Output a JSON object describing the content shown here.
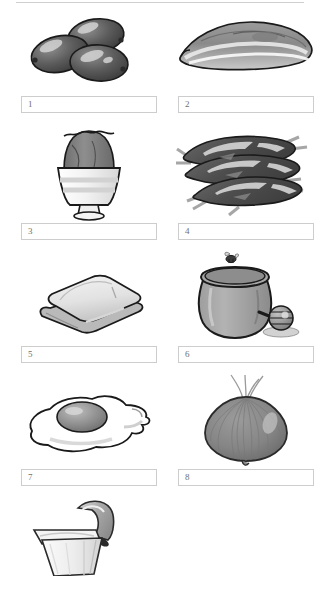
{
  "page": {
    "top_rule_color": "#cfcfcf",
    "box_border_color": "#cdcdcd",
    "number_color": "#6f6f6f",
    "background": "#ffffff"
  },
  "items": [
    {
      "number": "1",
      "value": "",
      "placeholder": "",
      "picture": "olives-illustration",
      "alt": "three black olives"
    },
    {
      "number": "2",
      "value": "",
      "placeholder": "",
      "picture": "flatfish-illustration",
      "alt": "flat fish / sole"
    },
    {
      "number": "3",
      "value": "",
      "placeholder": "",
      "picture": "boiled-egg-in-egg-cup-illustration",
      "alt": "boiled egg with opened top in an egg cup"
    },
    {
      "number": "4",
      "value": "",
      "placeholder": "",
      "picture": "sardines-illustration",
      "alt": "three striped fish, sardines or anchovies"
    },
    {
      "number": "5",
      "value": "",
      "placeholder": "",
      "picture": "bread-slices-illustration",
      "alt": "two slices of bread"
    },
    {
      "number": "6",
      "value": "",
      "placeholder": "",
      "picture": "honey-jar-illustration",
      "alt": "honey jar with bee and honey dipper"
    },
    {
      "number": "7",
      "value": "",
      "placeholder": "",
      "picture": "fried-egg-illustration",
      "alt": "fried egg sunny side up"
    },
    {
      "number": "8",
      "value": "",
      "placeholder": "",
      "picture": "onion-illustration",
      "alt": "whole onion"
    },
    {
      "number": "9",
      "value": "",
      "placeholder": "",
      "picture": "yogurt-tub-illustration",
      "alt": "tub with peeled foil lid"
    }
  ]
}
